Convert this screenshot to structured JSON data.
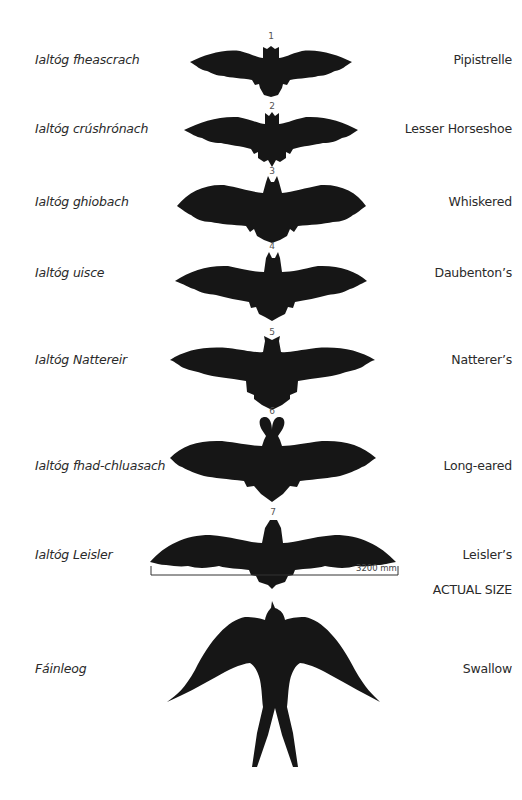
{
  "species": [
    {
      "number": "1",
      "irish": "Ialtóg fheascrach",
      "english": "Pipistrelle"
    },
    {
      "number": "2",
      "irish": "Ialtóg crúshrónach",
      "english": "Lesser Horseshoe"
    },
    {
      "number": "3",
      "irish": "Ialtóg ghiobach",
      "english": "Whiskered"
    },
    {
      "number": "4",
      "irish": "Ialtóg uisce",
      "english": "Daubenton’s"
    },
    {
      "number": "5",
      "irish": "Ialtóg Nattereir",
      "english": "Natterer’s"
    },
    {
      "number": "6",
      "irish": "Ialtóg fhad-chluasach",
      "english": "Long-eared"
    },
    {
      "number": "7",
      "irish": "Ialtóg Leisler",
      "english": "Leisler’s"
    }
  ],
  "scale": {
    "bar_label": "3200 mm",
    "note": "ACTUAL SIZE"
  },
  "swallow": {
    "irish": "Fáinleog",
    "english": "Swallow"
  },
  "colors": {
    "silhouette": "#161616",
    "text": "#2a2a2a",
    "background": "#ffffff"
  }
}
